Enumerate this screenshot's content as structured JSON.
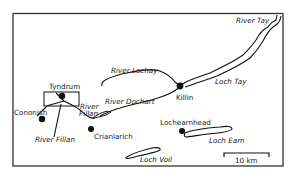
{
  "map": {
    "rivers": [
      {
        "name": "River Tay",
        "label": "River Tay"
      },
      {
        "name": "River Lochay",
        "label": "River Lochay"
      },
      {
        "name": "River Dochart",
        "label": "River Dochart"
      },
      {
        "name": "River Fillan (upper)",
        "label_line1": "River",
        "label_line2": "Fillan"
      },
      {
        "name": "River Fillan (lower)",
        "label": "River Fillan"
      }
    ],
    "lochs": [
      {
        "name": "Loch Tay",
        "label": "Loch Tay"
      },
      {
        "name": "Loch Earn",
        "label": "Loch Earn"
      },
      {
        "name": "Loch Voil",
        "label": "Loch Voil"
      }
    ],
    "settlements": [
      {
        "name": "Tyndrum",
        "label": "Tyndrum"
      },
      {
        "name": "Cononish",
        "label": "Cononish"
      },
      {
        "name": "Crianlarich",
        "label": "Crianlarich"
      },
      {
        "name": "Killin",
        "label": "Killin"
      },
      {
        "name": "Lochearnhead",
        "label": "Lochearnhead"
      }
    ],
    "scale_bar": {
      "label": "10 km"
    },
    "colors": {
      "ink": "#111111",
      "frame": "#333333",
      "background": "#ffffff"
    }
  }
}
